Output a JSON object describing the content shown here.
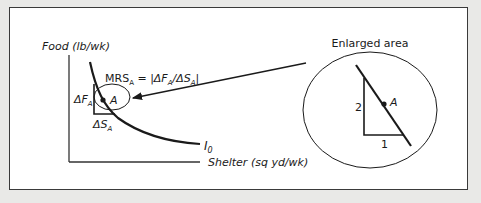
{
  "diagram": {
    "y_axis_label": "Food (lb/wk)",
    "x_axis_label": "Shelter (sq yd/wk)",
    "curve_label": {
      "base": "I",
      "sub": "0"
    },
    "point_label": "A",
    "delta_f_label": {
      "base": "ΔF",
      "sub": "A"
    },
    "delta_s_label": {
      "base": "ΔS",
      "sub": "A"
    },
    "mrs_formula": {
      "p1": "MRS",
      "p1_sub": "A",
      "p2": " = |ΔF",
      "p2_sub": "A",
      "p3": "/ΔS",
      "p3_sub": "A",
      "p4": "|"
    },
    "enlarged_title": "Enlarged area",
    "enlarged_point_label": "A",
    "rise_label": "2",
    "run_label": "1"
  },
  "colors": {
    "background": "#e9e9e7",
    "panel": "#ffffff",
    "ink": "#1a1a1a"
  }
}
